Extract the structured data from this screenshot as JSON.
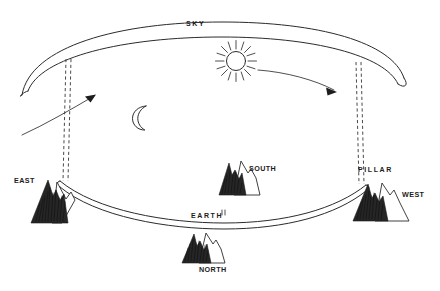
{
  "diagram": {
    "background_color": "#ffffff",
    "ink_color": "#2b2b2b",
    "labels": {
      "sky": "SKY",
      "earth": "EARTH",
      "east": "EAST",
      "west": "WEST",
      "north": "NORTH",
      "south": "SOUTH",
      "pillar": "PILLAR"
    },
    "icons": {
      "sun": "sun-icon",
      "moon": "crescent-moon-icon",
      "mountain_east": "mountain-icon",
      "mountain_west": "mountain-icon",
      "mountain_north": "mountain-icon",
      "mountain_south": "mountain-icon",
      "arrow_left": "arrow-up-right-icon",
      "arrow_right": "arrow-down-right-icon",
      "pillar_left": "dashed-pillar-icon",
      "pillar_right": "dashed-pillar-icon"
    },
    "elements": {
      "sky_band": "sky-vault-arc",
      "earth_band": "earth-disc-arc"
    }
  }
}
